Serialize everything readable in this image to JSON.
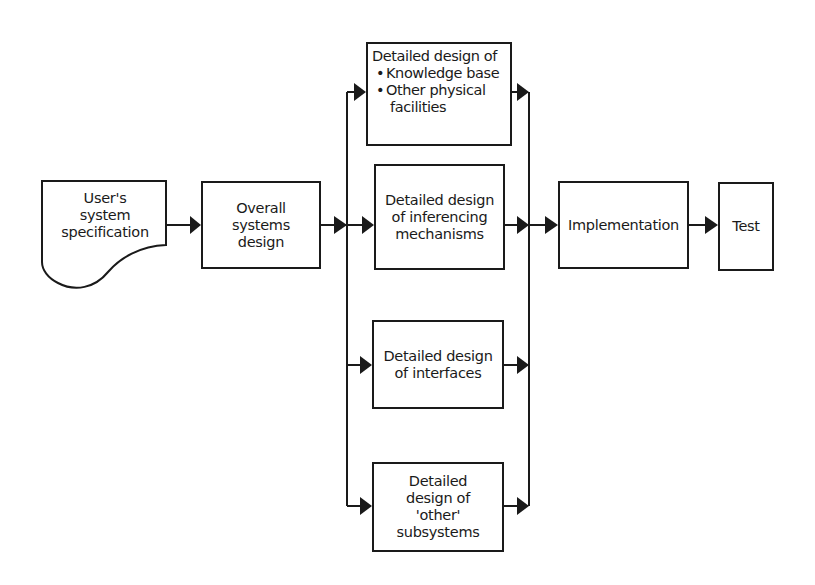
{
  "diagram": {
    "nodes": {
      "user_spec": {
        "lines": [
          "User's",
          "system",
          "specification"
        ],
        "shape": "document"
      },
      "overall": {
        "lines": [
          "Overall",
          "systems",
          "design"
        ]
      },
      "knowledge": {
        "heading": "Detailed design of",
        "bullets": [
          "Knowledge base",
          "Other physical"
        ],
        "continuation": "facilities"
      },
      "inferencing": {
        "lines": [
          "Detailed design",
          "of inferencing",
          "mechanisms"
        ]
      },
      "interfaces": {
        "lines": [
          "Detailed design",
          "of interfaces"
        ]
      },
      "other": {
        "lines": [
          "Detailed",
          "design of",
          "'other'",
          "subsystems"
        ]
      },
      "implementation": {
        "lines": [
          "Implementation"
        ]
      },
      "test": {
        "lines": [
          "Test"
        ]
      }
    },
    "edges": [
      {
        "from": "user_spec",
        "to": "overall"
      },
      {
        "from": "overall",
        "to": "knowledge"
      },
      {
        "from": "overall",
        "to": "inferencing"
      },
      {
        "from": "overall",
        "to": "interfaces"
      },
      {
        "from": "overall",
        "to": "other"
      },
      {
        "from": "knowledge",
        "to": "implementation"
      },
      {
        "from": "inferencing",
        "to": "implementation"
      },
      {
        "from": "interfaces",
        "to": "implementation"
      },
      {
        "from": "other",
        "to": "implementation"
      },
      {
        "from": "implementation",
        "to": "test"
      }
    ],
    "colors": {
      "stroke": "#1a1a1a",
      "background": "#ffffff"
    }
  }
}
